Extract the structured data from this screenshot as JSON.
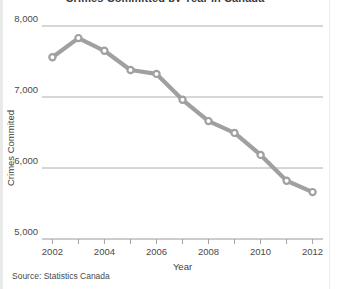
{
  "figure": {
    "title": "Crimes Committed by Year in Canada",
    "source_note": "Source: Statistics Canada",
    "background_color": "#ffffff",
    "series_color": "#a0a0a0",
    "grid_color": "#9a9a9a"
  },
  "chart_data": {
    "type": "line",
    "title": "Crimes Committed by Year in Canada",
    "xlabel": "Year",
    "ylabel": "Crimes Commited",
    "xlim": [
      2001.6,
      2012.4
    ],
    "ylim": [
      5000,
      8000
    ],
    "yticks": [
      5000,
      6000,
      7000,
      8000
    ],
    "ytick_labels": [
      "5,000",
      "6,000",
      "7,000",
      "8,000"
    ],
    "xticks": [
      2002,
      2003,
      2004,
      2005,
      2006,
      2007,
      2008,
      2009,
      2010,
      2011,
      2012
    ],
    "xtick_labels": [
      "2002",
      "",
      "2004",
      "",
      "2006",
      "",
      "2008",
      "",
      "2010",
      "",
      "2012"
    ],
    "xtick_labels_major": [
      "2002",
      "2004",
      "2006",
      "2008",
      "2010",
      "2012"
    ],
    "grid": "horizontal",
    "legend": "none",
    "markers": "open-circle",
    "x": [
      2002,
      2003,
      2004,
      2005,
      2006,
      2007,
      2008,
      2009,
      2010,
      2011,
      2012
    ],
    "values": [
      7560,
      7830,
      7650,
      7380,
      7325,
      6960,
      6660,
      6495,
      6185,
      5820,
      5660
    ],
    "series": [
      {
        "name": "Crimes Commited",
        "values": [
          7560,
          7830,
          7650,
          7380,
          7325,
          6960,
          6660,
          6495,
          6185,
          5820,
          5660
        ]
      }
    ]
  }
}
